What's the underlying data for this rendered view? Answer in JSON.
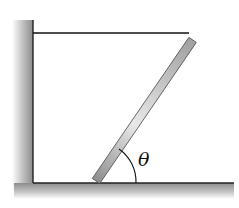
{
  "diagram": {
    "angle_label": "θ",
    "colors": {
      "ground_fill": "#9a9a9a",
      "rod_fill": "#b8b8b8",
      "rod_highlight": "#e6e6e6",
      "line": "#111111"
    }
  }
}
